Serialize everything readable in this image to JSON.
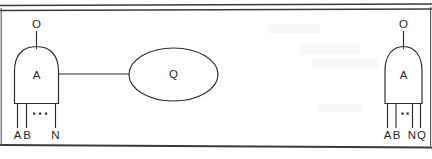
{
  "figure": {
    "caption_text": "",
    "background_color": "#ffffff",
    "ink_color": "#2a2a2a",
    "borders": {
      "top_rule_count": 2,
      "bottom_rule_count": 1,
      "left_edge_visible": true,
      "right_edge_visible": true
    },
    "gates": [
      {
        "id": "gate-left",
        "shape": "and-gate",
        "body_label": "A",
        "output_label": "O",
        "input_labels": [
          "A",
          "B",
          "N"
        ],
        "input_ellipsis": "· · ·",
        "input_count_shown": 3,
        "has_output_wire_right": true
      },
      {
        "id": "gate-right",
        "shape": "and-gate",
        "body_label": "A",
        "output_label": "O",
        "input_labels": [
          "A",
          "B",
          "N",
          "Q"
        ],
        "input_ellipsis": "· ·",
        "input_count_shown": 4,
        "has_output_wire_right": false
      }
    ],
    "nodes": [
      {
        "id": "node-q",
        "shape": "ellipse",
        "label": "Q"
      }
    ],
    "wires": [
      {
        "id": "wire-gate-left-to-node-q",
        "from": "gate-left",
        "to": "node-q",
        "style": "solid"
      }
    ]
  }
}
